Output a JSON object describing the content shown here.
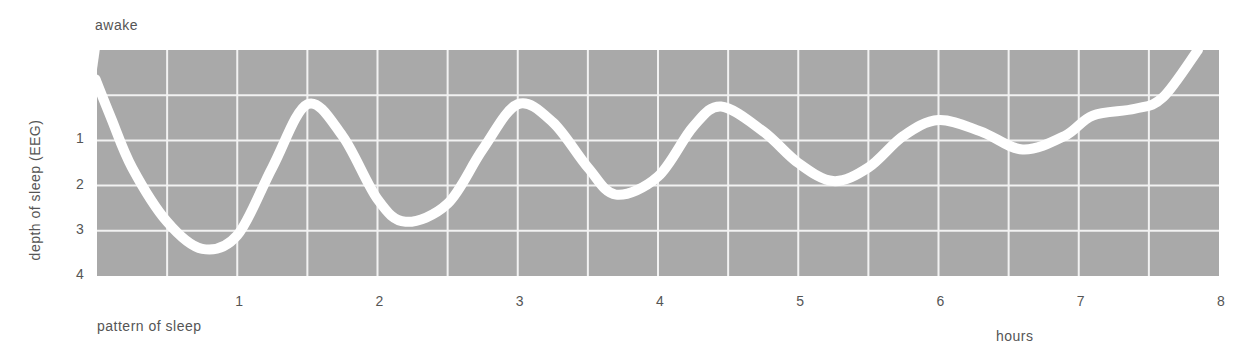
{
  "chart_data": {
    "type": "line",
    "title": "pattern of sleep",
    "xlabel": "hours",
    "ylabel": "depth of sleep (EEG)",
    "top_label": "awake",
    "x_ticks": [
      "1",
      "2",
      "3",
      "4",
      "5",
      "6",
      "7",
      "8"
    ],
    "y_ticks": [
      "1",
      "2",
      "3",
      "4"
    ],
    "xlim": [
      0,
      8
    ],
    "ylim": [
      -1,
      4
    ],
    "y_inverted": true,
    "grid": true,
    "grid_cells": {
      "columns": 16,
      "rows": 5
    },
    "colors": {
      "background": "#a9a9a9",
      "grid": "#f2f2f2",
      "line": "#ffffff",
      "text": "#555555"
    },
    "series": [
      {
        "name": "depth of sleep",
        "x": [
          -0.01,
          0.1,
          0.25,
          0.5,
          0.75,
          1.0,
          1.25,
          1.5,
          1.75,
          2.0,
          2.2,
          2.5,
          2.75,
          3.0,
          3.25,
          3.5,
          3.7,
          4.0,
          4.25,
          4.45,
          4.75,
          5.0,
          5.25,
          5.5,
          5.75,
          6.0,
          6.3,
          6.6,
          6.9,
          7.1,
          7.4,
          7.6,
          7.85
        ],
        "values": [
          -0.35,
          0.5,
          1.6,
          2.8,
          3.4,
          3.1,
          1.6,
          0.2,
          0.9,
          2.3,
          2.8,
          2.4,
          1.2,
          0.2,
          0.6,
          1.6,
          2.2,
          1.8,
          0.7,
          0.25,
          0.8,
          1.5,
          1.9,
          1.6,
          0.9,
          0.55,
          0.8,
          1.2,
          0.9,
          0.45,
          0.3,
          0.05,
          -1.0
        ]
      }
    ]
  }
}
